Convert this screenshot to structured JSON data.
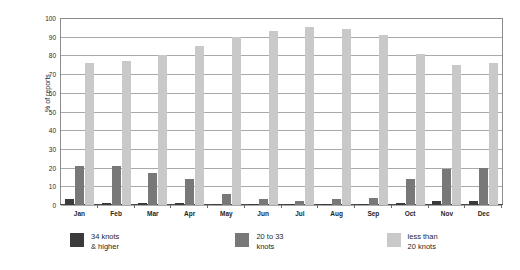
{
  "title_remnant": "",
  "chart_data": {
    "type": "bar",
    "title": "",
    "xlabel": "",
    "ylabel": "% of reports",
    "ylim": [
      0,
      100
    ],
    "yticks": [
      0,
      10,
      20,
      30,
      40,
      50,
      60,
      70,
      80,
      90,
      100
    ],
    "grid": true,
    "legend_position": "bottom",
    "categories": [
      "Jan",
      "Feb",
      "Mar",
      "Apr",
      "May",
      "Jun",
      "Jul",
      "Aug",
      "Sep",
      "Oct",
      "Nov",
      "Dec"
    ],
    "series": [
      {
        "name": "34 knots & higher",
        "color": "#3b3b3b",
        "values": [
          3,
          1,
          1,
          1,
          0.5,
          0.5,
          0.3,
          0.3,
          0.5,
          1,
          2,
          2
        ]
      },
      {
        "name": "20 to 33 knots",
        "color": "#787878",
        "values": [
          21,
          21,
          17,
          14,
          6,
          3,
          2,
          3,
          4,
          14,
          19,
          20
        ]
      },
      {
        "name": "less than 20 knots",
        "color": "#c9c9c9",
        "values": [
          76,
          77,
          80,
          85,
          90,
          93,
          95,
          94,
          91,
          81,
          75,
          76
        ]
      }
    ]
  },
  "legend": [
    {
      "label": "34 knots\n& higher",
      "swatch": "#3b3b3b"
    },
    {
      "label": "20 to 33\nknots",
      "swatch": "#787878"
    },
    {
      "label": "less than\n20 knots",
      "swatch": "#c9c9c9"
    }
  ]
}
